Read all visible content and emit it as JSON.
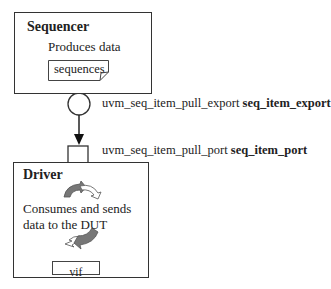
{
  "sequencer": {
    "title": "Sequencer",
    "description": "Produces data",
    "sequences_label": "sequences"
  },
  "export": {
    "type_label": "uvm_seq_item_pull_export",
    "instance_label": "seq_item_export"
  },
  "port": {
    "type_label": "uvm_seq_item_pull_port",
    "instance_label": "seq_item_port"
  },
  "driver": {
    "title": "Driver",
    "description_line1": "Consumes and sends",
    "description_line2": "data to the DUT",
    "vif_label": "vif"
  },
  "colors": {
    "border": "#333333",
    "arrow_fill": "#777777"
  }
}
